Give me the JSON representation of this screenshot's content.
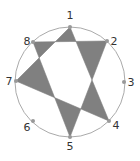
{
  "diagram": {
    "circle": {
      "cx": 70,
      "cy": 82,
      "r": 55,
      "stroke": "#aaaaaa"
    },
    "fill_color": "#808080",
    "points": [
      {
        "label": "1",
        "x": 70,
        "y": 27,
        "lx": 70,
        "ly": 19
      },
      {
        "label": "2",
        "x": 107,
        "y": 41,
        "lx": 114,
        "ly": 45
      },
      {
        "label": "3",
        "x": 124,
        "y": 82,
        "lx": 131,
        "ly": 86
      },
      {
        "label": "4",
        "x": 109,
        "y": 121,
        "lx": 116,
        "ly": 129
      },
      {
        "label": "5",
        "x": 70,
        "y": 137,
        "lx": 70,
        "ly": 150
      },
      {
        "label": "6",
        "x": 33,
        "y": 121,
        "lx": 27,
        "ly": 131
      },
      {
        "label": "7",
        "x": 16,
        "y": 81,
        "lx": 9,
        "ly": 85
      },
      {
        "label": "8",
        "x": 33,
        "y": 42,
        "lx": 27,
        "ly": 45
      }
    ],
    "triangles": [
      [
        "8",
        "2",
        "5"
      ],
      [
        "1",
        "7",
        "4"
      ]
    ]
  }
}
